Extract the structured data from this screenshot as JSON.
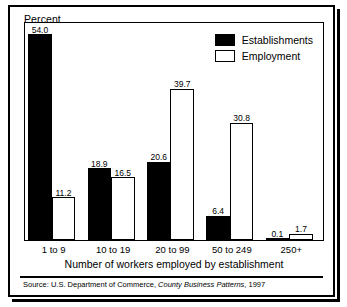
{
  "figure": {
    "y_axis_label": "Percent",
    "x_axis_label": "Number of workers employed by establishment",
    "source": {
      "prefix": "Source: U.S. Department of Commerce, ",
      "publication": "County Business Patterns",
      "suffix": ", 1997"
    }
  },
  "legend": {
    "items": [
      {
        "label": "Establishments",
        "swatch": "black-filled-square",
        "color": "#000000"
      },
      {
        "label": "Employment",
        "swatch": "white-outlined-square",
        "color": "#ffffff"
      }
    ]
  },
  "chart_data": {
    "type": "bar",
    "title": "",
    "xlabel": "Number of workers employed by establishment",
    "ylabel": "Percent",
    "ylim": [
      0,
      57
    ],
    "grid": false,
    "legend_position": "top-right",
    "categories": [
      "1 to 9",
      "10 to 19",
      "20 to 99",
      "50 to 249",
      "250+"
    ],
    "series": [
      {
        "name": "Establishments",
        "values": [
          54.0,
          18.9,
          20.6,
          6.4,
          0.1
        ]
      },
      {
        "name": "Employment",
        "values": [
          11.2,
          16.5,
          39.7,
          30.8,
          1.7
        ]
      }
    ],
    "data_labels": {
      "Establishments": [
        "54.0",
        "18.9",
        "20.6",
        "6.4",
        "0.1"
      ],
      "Employment": [
        "11.2",
        "16.5",
        "39.7",
        "30.8",
        "1.7"
      ]
    }
  }
}
